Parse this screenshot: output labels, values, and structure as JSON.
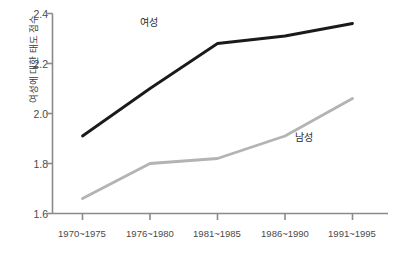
{
  "chart_data": {
    "type": "line",
    "title": "",
    "xlabel": "",
    "ylabel": "여성에 대한 태도 점수",
    "categories": [
      "1970~1975",
      "1976~1980",
      "1981~1985",
      "1986~1990",
      "1991~1995"
    ],
    "ylim": [
      1.6,
      2.4
    ],
    "yticks": [
      "1.6",
      "1.8",
      "2.0",
      "2.2",
      "2.4"
    ],
    "ytick_values": [
      1.6,
      1.8,
      2.0,
      2.2,
      2.4
    ],
    "grid": false,
    "legend_position": "inline-annotations",
    "series": [
      {
        "name": "여성",
        "color": "#1a1a1a",
        "values": [
          1.91,
          2.1,
          2.28,
          2.31,
          2.36
        ],
        "label_x_category": "1976~1980",
        "label_y_value": 2.31
      },
      {
        "name": "남성",
        "color": "#b3b3b3",
        "values": [
          1.66,
          1.8,
          1.82,
          1.91,
          2.06
        ],
        "label_x_category": "1986~1990",
        "label_y_value": 1.875
      }
    ]
  },
  "axes": {
    "y_axis_color": "#8a8a8a",
    "x_axis_color": "#8a8a8a"
  }
}
